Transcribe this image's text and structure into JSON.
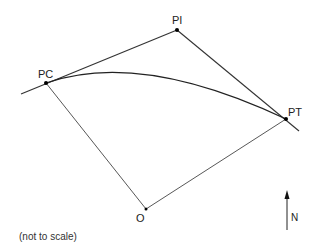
{
  "diagram": {
    "type": "horizontal-curve",
    "points": {
      "PC": {
        "label": "PC",
        "x": 46,
        "y": 83
      },
      "PI": {
        "label": "PI",
        "x": 177,
        "y": 30
      },
      "PT": {
        "label": "PT",
        "x": 286,
        "y": 119
      },
      "O": {
        "label": "O",
        "x": 146,
        "y": 209
      }
    },
    "north_arrow": {
      "label": "N"
    },
    "note": "(not to scale)",
    "colors": {
      "line": "#333333",
      "curve": "#222222",
      "point": "#000000"
    }
  }
}
